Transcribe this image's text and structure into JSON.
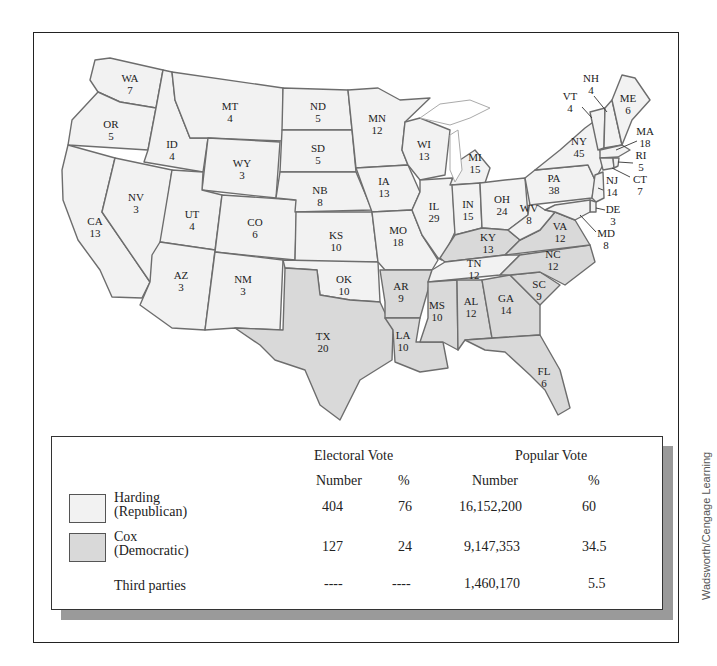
{
  "map": {
    "title": "Election of 1920",
    "colors": {
      "republican": "#f2f2f2",
      "democratic": "#d9d9d9",
      "border": "#6d6d6d"
    },
    "states": [
      {
        "abbr": "WA",
        "ev": "7",
        "party": "Harding"
      },
      {
        "abbr": "OR",
        "ev": "5",
        "party": "Harding"
      },
      {
        "abbr": "CA",
        "ev": "13",
        "party": "Harding"
      },
      {
        "abbr": "ID",
        "ev": "4",
        "party": "Harding"
      },
      {
        "abbr": "NV",
        "ev": "3",
        "party": "Harding"
      },
      {
        "abbr": "MT",
        "ev": "4",
        "party": "Harding"
      },
      {
        "abbr": "WY",
        "ev": "3",
        "party": "Harding"
      },
      {
        "abbr": "UT",
        "ev": "4",
        "party": "Harding"
      },
      {
        "abbr": "AZ",
        "ev": "3",
        "party": "Harding"
      },
      {
        "abbr": "CO",
        "ev": "6",
        "party": "Harding"
      },
      {
        "abbr": "NM",
        "ev": "3",
        "party": "Harding"
      },
      {
        "abbr": "ND",
        "ev": "5",
        "party": "Harding"
      },
      {
        "abbr": "SD",
        "ev": "5",
        "party": "Harding"
      },
      {
        "abbr": "NB",
        "ev": "8",
        "party": "Harding"
      },
      {
        "abbr": "KS",
        "ev": "10",
        "party": "Harding"
      },
      {
        "abbr": "OK",
        "ev": "10",
        "party": "Harding"
      },
      {
        "abbr": "TX",
        "ev": "20",
        "party": "Cox"
      },
      {
        "abbr": "MN",
        "ev": "12",
        "party": "Harding"
      },
      {
        "abbr": "IA",
        "ev": "13",
        "party": "Harding"
      },
      {
        "abbr": "MO",
        "ev": "18",
        "party": "Harding"
      },
      {
        "abbr": "AR",
        "ev": "9",
        "party": "Cox"
      },
      {
        "abbr": "LA",
        "ev": "10",
        "party": "Cox"
      },
      {
        "abbr": "WI",
        "ev": "13",
        "party": "Harding"
      },
      {
        "abbr": "IL",
        "ev": "29",
        "party": "Harding"
      },
      {
        "abbr": "MI",
        "ev": "15",
        "party": "Harding"
      },
      {
        "abbr": "IN",
        "ev": "15",
        "party": "Harding"
      },
      {
        "abbr": "OH",
        "ev": "24",
        "party": "Harding"
      },
      {
        "abbr": "KY",
        "ev": "13",
        "party": "Cox"
      },
      {
        "abbr": "TN",
        "ev": "12",
        "party": "Harding"
      },
      {
        "abbr": "MS",
        "ev": "10",
        "party": "Cox"
      },
      {
        "abbr": "AL",
        "ev": "12",
        "party": "Cox"
      },
      {
        "abbr": "GA",
        "ev": "14",
        "party": "Cox"
      },
      {
        "abbr": "FL",
        "ev": "6",
        "party": "Cox"
      },
      {
        "abbr": "SC",
        "ev": "9",
        "party": "Cox"
      },
      {
        "abbr": "NC",
        "ev": "12",
        "party": "Cox"
      },
      {
        "abbr": "VA",
        "ev": "12",
        "party": "Cox"
      },
      {
        "abbr": "WV",
        "ev": "8",
        "party": "Harding"
      },
      {
        "abbr": "PA",
        "ev": "38",
        "party": "Harding"
      },
      {
        "abbr": "NY",
        "ev": "45",
        "party": "Harding"
      },
      {
        "abbr": "VT",
        "ev": "4",
        "party": "Harding"
      },
      {
        "abbr": "NH",
        "ev": "4",
        "party": "Harding"
      },
      {
        "abbr": "ME",
        "ev": "6",
        "party": "Harding"
      },
      {
        "abbr": "MA",
        "ev": "18",
        "party": "Harding"
      },
      {
        "abbr": "RI",
        "ev": "5",
        "party": "Harding"
      },
      {
        "abbr": "CT",
        "ev": "7",
        "party": "Harding"
      },
      {
        "abbr": "NJ",
        "ev": "14",
        "party": "Harding"
      },
      {
        "abbr": "DE",
        "ev": "3",
        "party": "Harding"
      },
      {
        "abbr": "MD",
        "ev": "8",
        "party": "Harding"
      }
    ]
  },
  "legend": {
    "headers": {
      "electoral": "Electoral Vote",
      "popular": "Popular Vote",
      "ev_number": "Number",
      "ev_pct": "%",
      "pv_number": "Number",
      "pv_pct": "%"
    },
    "rows": [
      {
        "name_line1": "Harding",
        "name_line2": "(Republican)",
        "ev_number": "404",
        "ev_pct": "76",
        "pv_number": "16,152,200",
        "pv_pct": "60",
        "swatch": "#f2f2f2"
      },
      {
        "name_line1": "Cox",
        "name_line2": "(Democratic)",
        "ev_number": "127",
        "ev_pct": "24",
        "pv_number": "9,147,353",
        "pv_pct": "34.5",
        "swatch": "#d9d9d9"
      },
      {
        "name_line1": "Third parties",
        "name_line2": "",
        "ev_number": "----",
        "ev_pct": "----",
        "pv_number": "1,460,170",
        "pv_pct": "5.5",
        "swatch": ""
      }
    ]
  },
  "credit": "Wadsworth/Cengage Learning"
}
